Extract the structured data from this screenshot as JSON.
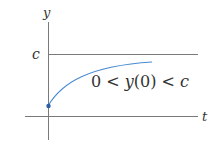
{
  "diagram": {
    "y_axis_label": "y",
    "x_axis_label": "t",
    "asymptote_label": "c",
    "curve_label": {
      "part1": "0 < ",
      "part2": "y",
      "part3": "(0) < ",
      "part4": "c"
    },
    "colors": {
      "axes": "#7a7a7a",
      "curve": "#4a8ad0",
      "point": "#2a5fa8",
      "text": "#333333"
    }
  }
}
